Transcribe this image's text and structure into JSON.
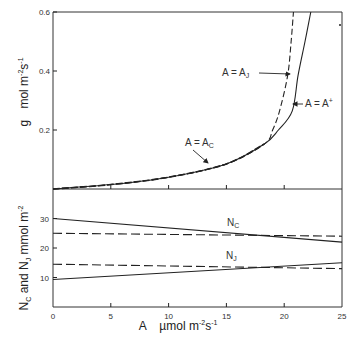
{
  "chart_data": [
    {
      "type": "line",
      "panel": "top",
      "title": "",
      "xlabel": "A  µmol m-2s-1",
      "ylabel": "g  mol m-2s-1",
      "xlim": [
        0,
        25
      ],
      "ylim": [
        0,
        0.6
      ],
      "yticks": [
        0.2,
        0.4,
        0.6
      ],
      "ytick_labels": [
        "0.2",
        "0.4",
        "0.6"
      ],
      "xticks": [
        5,
        10,
        15,
        20
      ],
      "grid": false,
      "series": [
        {
          "name": "A = A+",
          "style": "solid",
          "points": [
            [
              0,
              0
            ],
            [
              5,
              0.015
            ],
            [
              10,
              0.04
            ],
            [
              15,
              0.085
            ],
            [
              18.3,
              0.153
            ],
            [
              19.5,
              0.2
            ],
            [
              20.7,
              0.265
            ],
            [
              21.2,
              0.385
            ],
            [
              21.8,
              0.5
            ],
            [
              22.3,
              0.6
            ]
          ]
        },
        {
          "name": "A = AJ",
          "style": "dashed",
          "points": [
            [
              0,
              0
            ],
            [
              5,
              0.015
            ],
            [
              10,
              0.04
            ],
            [
              15,
              0.085
            ],
            [
              18.3,
              0.153
            ],
            [
              19.0,
              0.2
            ],
            [
              19.6,
              0.265
            ],
            [
              20.3,
              0.385
            ],
            [
              20.6,
              0.5
            ],
            [
              20.8,
              0.6
            ]
          ]
        },
        {
          "name": "A = AC",
          "style": "dashed",
          "points": [
            [
              0,
              0
            ],
            [
              5,
              0.015
            ],
            [
              10,
              0.04
            ],
            [
              15,
              0.085
            ],
            [
              18.3,
              0.153
            ]
          ]
        }
      ],
      "annotations": [
        {
          "text": "A = A",
          "sub": "J",
          "x": 222,
          "y": 76,
          "arrow": [
            259,
            73,
            290,
            74
          ]
        },
        {
          "text": "A = A",
          "sup": "+",
          "x": 305,
          "y": 107,
          "arrow": [
            303,
            104,
            293,
            104
          ]
        },
        {
          "text": "A = A",
          "sub": "C",
          "x": 185,
          "y": 146,
          "arrow": [
            193,
            150,
            208,
            163
          ]
        }
      ]
    },
    {
      "type": "line",
      "panel": "bottom",
      "title": "",
      "xlabel": "A  µmol m-2s-1",
      "ylabel": "NC and NJ mmol m-2",
      "xlim": [
        0,
        25
      ],
      "ylim": [
        0,
        40
      ],
      "yticks": [
        10,
        20,
        30
      ],
      "ytick_labels": [
        "10",
        "20",
        "30"
      ],
      "xticks": [
        0,
        5,
        10,
        15,
        20,
        25
      ],
      "xtick_labels": [
        "0",
        "5",
        "10",
        "15",
        "20",
        "25"
      ],
      "grid": false,
      "series": [
        {
          "name": "NC",
          "style": "solid",
          "points": [
            [
              0,
              30
            ],
            [
              25,
              22
            ]
          ]
        },
        {
          "name": "NC",
          "style": "dashed",
          "points": [
            [
              0,
              25
            ],
            [
              25,
              24
            ]
          ]
        },
        {
          "name": "NJ",
          "style": "dashed",
          "points": [
            [
              0,
              14.5
            ],
            [
              25,
              13
            ]
          ]
        },
        {
          "name": "NJ",
          "style": "solid",
          "points": [
            [
              0,
              9.3
            ],
            [
              25,
              15
            ]
          ]
        }
      ],
      "annotations": [
        {
          "text": "N",
          "sub": "C",
          "x": 227,
          "y": 226
        },
        {
          "text": "N",
          "sub": "J",
          "x": 226,
          "y": 259
        }
      ]
    }
  ],
  "labels": {
    "x_axis_main": "A",
    "x_axis_unit": "µmol m",
    "x_axis_exp1": "-2",
    "x_axis_s": "s",
    "x_axis_exp2": "-1",
    "y_top_main": "g",
    "y_top_unit": "mol m",
    "y_top_exp1": "-2",
    "y_top_s": "s",
    "y_top_exp2": "-1",
    "y_bottom_n1": "N",
    "y_bottom_n1_sub": "C",
    "y_bottom_and": " and ",
    "y_bottom_n2": "N",
    "y_bottom_n2_sub": "J",
    "y_bottom_unit": " mmol m",
    "y_bottom_exp": "-2"
  },
  "colors": {
    "line": "#222222",
    "frame": "#333333",
    "background": "#ffffff"
  }
}
